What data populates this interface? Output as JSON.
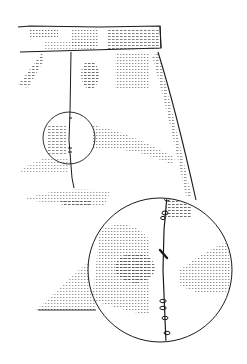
{
  "figure": {
    "caption": "",
    "colors": {
      "background": "#ffffff",
      "ink": "#1a1a1a",
      "stipple": "#3a3a3a"
    },
    "parts": {
      "waistband": "waistband",
      "skirt_body": "skirt-body",
      "zipper_seam": "center-zipper-seam",
      "detail_circle_small": "zipper-detail-callout",
      "detail_circle_large": "magnified-zipper-view"
    }
  }
}
